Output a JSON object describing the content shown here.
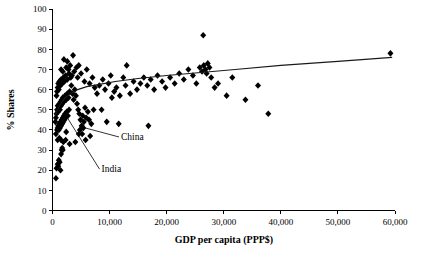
{
  "chart_data": {
    "type": "scatter",
    "title": "",
    "xlabel": "GDP per capita (PPP$)",
    "ylabel": "% Shares",
    "xlim": [
      0,
      60000
    ],
    "ylim": [
      0,
      100
    ],
    "xticks": [
      0,
      10000,
      20000,
      30000,
      40000,
      50000,
      60000
    ],
    "xtick_labels": [
      "0",
      "10,000",
      "20,000",
      "30,000",
      "40,000",
      "50,000",
      "60,000"
    ],
    "yticks": [
      0,
      10,
      20,
      30,
      40,
      50,
      60,
      70,
      80,
      90,
      100
    ],
    "ytick_labels": [
      "0",
      "10",
      "20",
      "30",
      "40",
      "50",
      "60",
      "70",
      "80",
      "90",
      "100"
    ],
    "grid": false,
    "legend": false,
    "marker": "diamond",
    "marker_color": "#000000",
    "points": [
      [
        600,
        16
      ],
      [
        700,
        21
      ],
      [
        900,
        23
      ],
      [
        1000,
        22
      ],
      [
        1100,
        25
      ],
      [
        1250,
        24
      ],
      [
        1400,
        20
      ],
      [
        1500,
        28
      ],
      [
        1600,
        30
      ],
      [
        1700,
        31
      ],
      [
        1800,
        30
      ],
      [
        900,
        35
      ],
      [
        1200,
        36
      ],
      [
        1500,
        35
      ],
      [
        1900,
        34
      ],
      [
        2300,
        35
      ],
      [
        600,
        38
      ],
      [
        800,
        40
      ],
      [
        900,
        41
      ],
      [
        1000,
        42
      ],
      [
        1100,
        40
      ],
      [
        1200,
        43
      ],
      [
        1300,
        41
      ],
      [
        1400,
        44
      ],
      [
        1500,
        42
      ],
      [
        1600,
        45
      ],
      [
        1700,
        43
      ],
      [
        1800,
        46
      ],
      [
        1900,
        44
      ],
      [
        2000,
        47
      ],
      [
        2100,
        45
      ],
      [
        2200,
        48
      ],
      [
        2300,
        46
      ],
      [
        2500,
        49
      ],
      [
        2700,
        47
      ],
      [
        2900,
        50
      ],
      [
        500,
        44
      ],
      [
        600,
        46
      ],
      [
        700,
        48
      ],
      [
        800,
        50
      ],
      [
        900,
        52
      ],
      [
        1000,
        49
      ],
      [
        1100,
        51
      ],
      [
        1200,
        53
      ],
      [
        1300,
        50
      ],
      [
        1400,
        54
      ],
      [
        1500,
        52
      ],
      [
        1600,
        55
      ],
      [
        1700,
        53
      ],
      [
        1800,
        56
      ],
      [
        2000,
        54
      ],
      [
        2200,
        57
      ],
      [
        2400,
        55
      ],
      [
        2600,
        58
      ],
      [
        2800,
        56
      ],
      [
        3000,
        59
      ],
      [
        700,
        57
      ],
      [
        800,
        59
      ],
      [
        900,
        61
      ],
      [
        1000,
        63
      ],
      [
        1100,
        60
      ],
      [
        1200,
        64
      ],
      [
        1400,
        62
      ],
      [
        1500,
        65
      ],
      [
        1700,
        63
      ],
      [
        1900,
        66
      ],
      [
        2100,
        64
      ],
      [
        2300,
        67
      ],
      [
        2600,
        65
      ],
      [
        2900,
        68
      ],
      [
        3200,
        66
      ],
      [
        1500,
        70
      ],
      [
        1800,
        69
      ],
      [
        2400,
        71
      ],
      [
        2800,
        70
      ],
      [
        3100,
        72
      ],
      [
        2000,
        75
      ],
      [
        2600,
        74
      ],
      [
        3600,
        77
      ],
      [
        4200,
        71
      ],
      [
        4600,
        72
      ],
      [
        3300,
        62
      ],
      [
        3500,
        58
      ],
      [
        3700,
        55
      ],
      [
        3900,
        60
      ],
      [
        4100,
        57
      ],
      [
        4300,
        53
      ],
      [
        4500,
        50
      ],
      [
        4700,
        48
      ],
      [
        4900,
        45
      ],
      [
        5100,
        42
      ],
      [
        5300,
        47
      ],
      [
        5500,
        44
      ],
      [
        5700,
        51
      ],
      [
        5900,
        46
      ],
      [
        6200,
        49
      ],
      [
        3400,
        67
      ],
      [
        3800,
        69
      ],
      [
        4400,
        66
      ],
      [
        5000,
        68
      ],
      [
        5600,
        64
      ],
      [
        6000,
        70
      ],
      [
        6500,
        63
      ],
      [
        7000,
        66
      ],
      [
        7400,
        61
      ],
      [
        7800,
        58
      ],
      [
        4800,
        40
      ],
      [
        5200,
        38
      ],
      [
        5400,
        41
      ],
      [
        6400,
        45
      ],
      [
        6800,
        43
      ],
      [
        7200,
        50
      ],
      [
        8600,
        50
      ],
      [
        9500,
        44
      ],
      [
        10400,
        56
      ],
      [
        11600,
        43
      ],
      [
        8200,
        62
      ],
      [
        8800,
        65
      ],
      [
        9200,
        60
      ],
      [
        9800,
        63
      ],
      [
        10200,
        67
      ],
      [
        10800,
        59
      ],
      [
        11200,
        61
      ],
      [
        11800,
        57
      ],
      [
        12400,
        66
      ],
      [
        13000,
        72
      ],
      [
        12800,
        62
      ],
      [
        13600,
        58
      ],
      [
        14200,
        64
      ],
      [
        14800,
        60
      ],
      [
        15400,
        63
      ],
      [
        16000,
        66
      ],
      [
        16600,
        62
      ],
      [
        17200,
        65
      ],
      [
        17800,
        60
      ],
      [
        18400,
        67
      ],
      [
        16800,
        42
      ],
      [
        19200,
        64
      ],
      [
        19800,
        61
      ],
      [
        20600,
        66
      ],
      [
        21400,
        63
      ],
      [
        22200,
        68
      ],
      [
        23000,
        65
      ],
      [
        23800,
        70
      ],
      [
        24600,
        67
      ],
      [
        25200,
        63
      ],
      [
        25800,
        71
      ],
      [
        26200,
        69
      ],
      [
        26500,
        72
      ],
      [
        26800,
        70
      ],
      [
        27000,
        68
      ],
      [
        27200,
        73
      ],
      [
        27500,
        71
      ],
      [
        26400,
        87
      ],
      [
        27800,
        66
      ],
      [
        28400,
        61
      ],
      [
        29000,
        63
      ],
      [
        30500,
        57
      ],
      [
        31500,
        66
      ],
      [
        33800,
        55
      ],
      [
        36000,
        62
      ],
      [
        37800,
        48
      ],
      [
        59200,
        78
      ],
      [
        5800,
        35
      ],
      [
        6600,
        37
      ],
      [
        3000,
        33
      ],
      [
        2400,
        39
      ],
      [
        4000,
        34
      ],
      [
        4600,
        38
      ]
    ],
    "trend": [
      [
        400,
        47
      ],
      [
        1200,
        52
      ],
      [
        2200,
        56
      ],
      [
        3200,
        58
      ],
      [
        4400,
        60
      ],
      [
        6000,
        61.5
      ],
      [
        8000,
        62.5
      ],
      [
        11000,
        64
      ],
      [
        15000,
        65.5
      ],
      [
        20000,
        67
      ],
      [
        26000,
        68.5
      ],
      [
        32000,
        70
      ],
      [
        40000,
        72
      ],
      [
        50000,
        74
      ],
      [
        59500,
        76
      ]
    ],
    "annotations": [
      {
        "label": "China",
        "label_x": 12000,
        "label_y": 35,
        "point_x": 5700,
        "point_y": 41
      },
      {
        "label": "India",
        "label_x": 8600,
        "label_y": 19,
        "point_x": 2600,
        "point_y": 46
      }
    ]
  }
}
